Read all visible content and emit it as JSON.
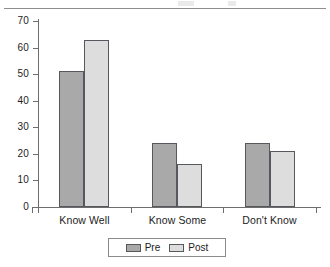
{
  "chart_data": {
    "type": "bar",
    "title": "",
    "subtitle": "",
    "xlabel": "",
    "ylabel": "",
    "categories": [
      "Know Well",
      "Know Some",
      "Don't Know"
    ],
    "series": [
      {
        "name": "Pre",
        "values": [
          51,
          24,
          24
        ],
        "color": "#a9a9a9"
      },
      {
        "name": "Post",
        "values": [
          63,
          16,
          21
        ],
        "color": "#dddddd"
      }
    ],
    "ylim": [
      0,
      70
    ],
    "ytick_step": 10,
    "yticks": [
      0,
      10,
      20,
      30,
      40,
      50,
      60,
      70
    ],
    "ytick_labels": [
      "0",
      "10",
      "20",
      "30",
      "40",
      "50",
      "60",
      "70"
    ],
    "grid": false,
    "legend_position": "bottom-center",
    "legend_entries": [
      "Pre",
      "Post"
    ],
    "annotations": []
  },
  "axes": {
    "y": {
      "ticks": [
        {
          "value": 70,
          "label": "70"
        },
        {
          "value": 60,
          "label": "60"
        },
        {
          "value": 50,
          "label": "50"
        },
        {
          "value": 40,
          "label": "40"
        },
        {
          "value": 30,
          "label": "30"
        },
        {
          "value": 20,
          "label": "20"
        },
        {
          "value": 10,
          "label": "10"
        },
        {
          "value": 0,
          "label": "0"
        }
      ]
    },
    "x": {
      "labels": [
        "Know Well",
        "Know Some",
        "Don't Know"
      ]
    }
  },
  "legend": {
    "items": [
      {
        "label": "Pre",
        "swatch": "pre-swatch"
      },
      {
        "label": "Post",
        "swatch": "post-swatch"
      }
    ]
  },
  "colors": {
    "pre": "#a9a9a9",
    "post": "#dddddd",
    "bar_outline": "#55585c",
    "axis": "#6d6d6d",
    "text": "#1d1d1d",
    "background": "#ffffff"
  }
}
